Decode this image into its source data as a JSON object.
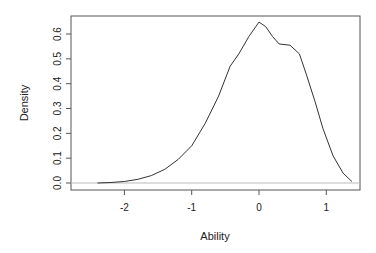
{
  "chart_data": {
    "type": "line",
    "title": "",
    "xlabel": "Ability",
    "ylabel": "Density",
    "xlim": [
      -2.55,
      1.5
    ],
    "ylim": [
      -0.02,
      0.67
    ],
    "xticks": [
      "-2",
      "-1",
      "0",
      "1"
    ],
    "yticks": [
      "0.0",
      "0.1",
      "0.2",
      "0.3",
      "0.4",
      "0.5",
      "0.6"
    ],
    "grid": false,
    "legend": null,
    "series": [
      {
        "name": "density",
        "x": [
          -2.4,
          -2.2,
          -2.0,
          -1.8,
          -1.6,
          -1.4,
          -1.2,
          -1.0,
          -0.8,
          -0.6,
          -0.43,
          -0.3,
          -0.15,
          0.0,
          0.1,
          0.2,
          0.3,
          0.46,
          0.6,
          0.7,
          0.83,
          0.95,
          1.1,
          1.25,
          1.38
        ],
        "values": [
          0.0,
          0.002,
          0.006,
          0.015,
          0.03,
          0.055,
          0.095,
          0.15,
          0.24,
          0.35,
          0.47,
          0.52,
          0.59,
          0.648,
          0.63,
          0.59,
          0.56,
          0.555,
          0.52,
          0.44,
          0.33,
          0.22,
          0.11,
          0.04,
          0.006
        ]
      }
    ],
    "baseline": 0.0
  }
}
